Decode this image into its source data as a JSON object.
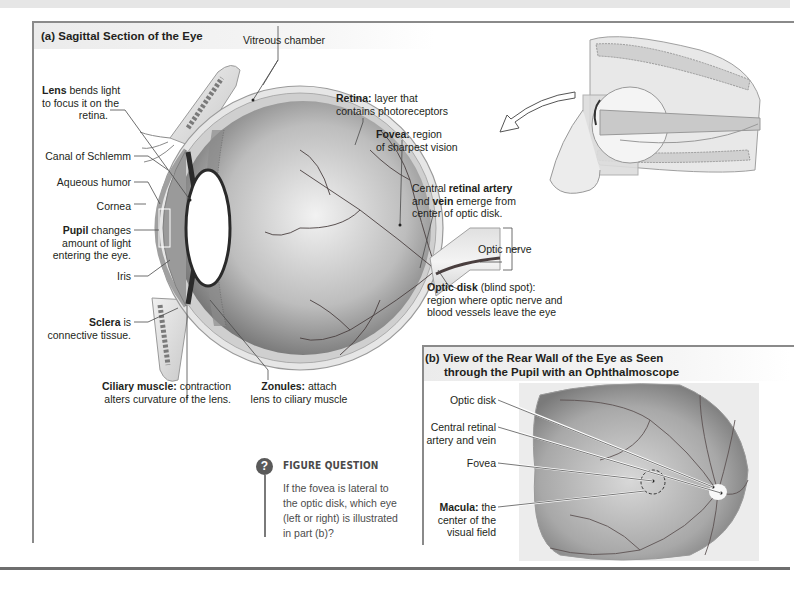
{
  "panel_a": {
    "title": "(a) Sagittal Section of the Eye",
    "labels": {
      "vitreous": "Vitreous chamber",
      "lens_bold": "Lens",
      "lens_l1": " bends light",
      "lens_l2": "to focus it on the",
      "lens_l3": "retina.",
      "canal": "Canal of Schlemm",
      "aqueous": "Aqueous humor",
      "cornea": "Cornea",
      "pupil_bold": "Pupil",
      "pupil_l1": " changes",
      "pupil_l2": "amount of light",
      "pupil_l3": "entering the eye.",
      "iris": "Iris",
      "sclera_bold": "Sclera",
      "sclera_l1": " is",
      "sclera_l2": "connective tissue.",
      "ciliary_bold": "Ciliary muscle:",
      "ciliary_l1": " contraction",
      "ciliary_l2": "alters curvature of the lens.",
      "zonules_bold": "Zonules:",
      "zonules_l1": " attach",
      "zonules_l2": "lens to ciliary muscle",
      "retina_bold": "Retina:",
      "retina_l1": " layer that",
      "retina_l2": "contains photoreceptors",
      "fovea_bold": "Fovea:",
      "fovea_l1": " region",
      "fovea_l2": "of sharpest vision",
      "artery_pre": "Central ",
      "artery_bold": "retinal artery",
      "artery_and": "and ",
      "artery_vein": "vein",
      "artery_l2": " emerge from",
      "artery_l3": "center of optic disk.",
      "optic_nerve": "Optic nerve",
      "disk_bold": "Optic disk",
      "disk_l1": " (blind spot):",
      "disk_l2": "region where optic nerve and",
      "disk_l3": "blood vessels leave the eye"
    }
  },
  "panel_b": {
    "title_l1": "(b) View of the Rear Wall of the Eye as Seen",
    "title_l2": "through the Pupil with an Ophthalmoscope",
    "labels": {
      "optic_disk": "Optic disk",
      "artery_l1": "Central retinal",
      "artery_l2": "artery and vein",
      "fovea": "Fovea",
      "macula_bold": "Macula:",
      "macula_l1": " the",
      "macula_l2": "center of the",
      "macula_l3": "visual field"
    }
  },
  "figure_question": {
    "icon": "?",
    "title": "FIGURE QUESTION",
    "text": "If the fovea is lateral to the optic disk, which eye (left or right) is illustrated in part (b)?"
  },
  "colors": {
    "frame": "#8a8a8a",
    "text": "#231f20",
    "leader": "#4a4a4a",
    "eye_dark": "#6e6e6e",
    "eye_light": "#d9d9d9"
  }
}
